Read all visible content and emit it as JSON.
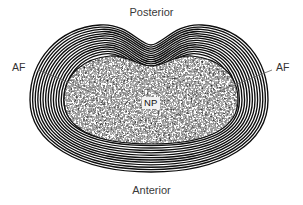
{
  "figure": {
    "background_color": "#ffffff",
    "width": 303,
    "height": 205
  },
  "labels": {
    "posterior": "Posterior",
    "anterior": "Anterior",
    "af_left": "AF",
    "af_right": "AF",
    "np": "NP"
  },
  "anatomy": {
    "outline_shape": "kidney-bean",
    "posterior_margin": "concave",
    "anterior_margin": "convex",
    "annulus_fibrosus": {
      "abbreviation": "AF",
      "lamellae_count": 14,
      "line_color": "#111111"
    },
    "nucleus_pulposus": {
      "abbreviation": "NP",
      "texture": "stipple",
      "fill_light": "#ffffff",
      "fill_dark": "#000000"
    }
  },
  "leader_lines": {
    "left": {
      "x1": 38,
      "y1": 70,
      "x2": 96,
      "y2": 94,
      "color": "#6b6b6b"
    },
    "right": {
      "x1": 272,
      "y1": 70,
      "x2": 212,
      "y2": 94,
      "color": "#6b6b6b"
    }
  }
}
